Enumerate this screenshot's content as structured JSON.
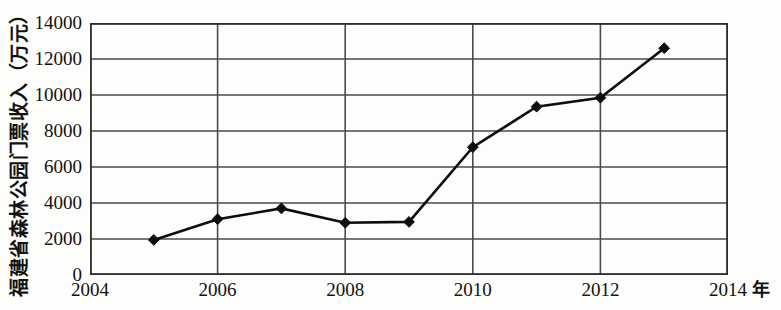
{
  "chart_data": {
    "type": "line",
    "title": "",
    "xlabel": "年",
    "ylabel": "福建省森林公园门票收入（万元）",
    "x": [
      2005,
      2006,
      2007,
      2008,
      2009,
      2010,
      2011,
      2012,
      2013
    ],
    "values": [
      1950,
      3100,
      3700,
      2900,
      2950,
      7100,
      9350,
      9850,
      12600
    ],
    "series": [
      {
        "name": "福建省森林公园门票收入",
        "values": [
          1950,
          3100,
          3700,
          2900,
          2950,
          7100,
          9350,
          9850,
          12600
        ]
      }
    ],
    "xlim": [
      2004,
      2014
    ],
    "ylim": [
      0,
      14000
    ],
    "x_ticks": [
      2004,
      2006,
      2008,
      2010,
      2012,
      2014
    ],
    "x_tick_labels": [
      "2004",
      "2006",
      "2008",
      "2010",
      "2012",
      "2014"
    ],
    "y_ticks": [
      0,
      2000,
      4000,
      6000,
      8000,
      10000,
      12000,
      14000
    ],
    "y_tick_labels": [
      "0",
      "2000",
      "4000",
      "6000",
      "8000",
      "10000",
      "12000",
      "14000"
    ],
    "grid": true,
    "grid_horizontal": true,
    "grid_vertical": true,
    "legend": null,
    "legend_position": "none",
    "marker": "diamond",
    "marker_color": "#0d0d0d",
    "line_color": "#0d0d0d",
    "line_width": 2.6,
    "grid_color": "#4a4a4a",
    "frame_color": "#2e2e2e",
    "background_color": "#fdfdfc"
  },
  "axes": {
    "y_unit_note": "万元",
    "x_unit_note": "年"
  }
}
